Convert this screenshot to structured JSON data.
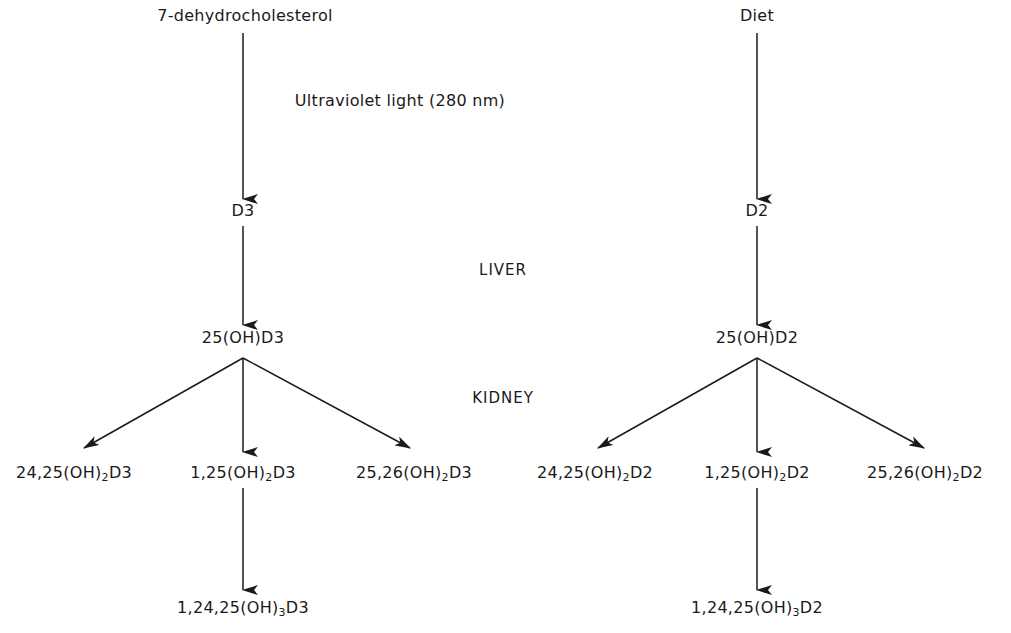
{
  "diagram": {
    "title": "",
    "colors": {
      "line": "#1a1a1a",
      "background": "#ffffff"
    },
    "annotations": {
      "uv": "Ultraviolet light (280 nm)",
      "liver": "LIVER",
      "kidney": "KIDNEY"
    },
    "left": {
      "source": "7-dehydrocholesterol",
      "vitamin": "D3",
      "hydroxy": "25(OH)D3",
      "metabolites": [
        {
          "pre": "24,25(OH)",
          "sub": "2",
          "post": "D3"
        },
        {
          "pre": "1,25(OH)",
          "sub": "2",
          "post": "D3"
        },
        {
          "pre": "25,26(OH)",
          "sub": "2",
          "post": "D3"
        }
      ],
      "final": {
        "pre": "1,24,25(OH)",
        "sub": "3",
        "post": "D3"
      }
    },
    "right": {
      "source": "Diet",
      "vitamin": "D2",
      "hydroxy": "25(OH)D2",
      "metabolites": [
        {
          "pre": "24,25(OH)",
          "sub": "2",
          "post": "D2"
        },
        {
          "pre": "1,25(OH)",
          "sub": "2",
          "post": "D2"
        },
        {
          "pre": "25,26(OH)",
          "sub": "2",
          "post": "D2"
        }
      ],
      "final": {
        "pre": "1,24,25(OH)",
        "sub": "3",
        "post": "D2"
      }
    },
    "edges": [
      {
        "from": "7-dehydrocholesterol",
        "to": "D3"
      },
      {
        "from": "D3",
        "to": "25(OH)D3"
      },
      {
        "from": "25(OH)D3",
        "to": "24,25(OH)2D3"
      },
      {
        "from": "25(OH)D3",
        "to": "1,25(OH)2D3"
      },
      {
        "from": "25(OH)D3",
        "to": "25,26(OH)2D3"
      },
      {
        "from": "1,25(OH)2D3",
        "to": "1,24,25(OH)3D3"
      },
      {
        "from": "Diet",
        "to": "D2"
      },
      {
        "from": "D2",
        "to": "25(OH)D2"
      },
      {
        "from": "25(OH)D2",
        "to": "24,25(OH)2D2"
      },
      {
        "from": "25(OH)D2",
        "to": "1,25(OH)2D2"
      },
      {
        "from": "25(OH)D2",
        "to": "25,26(OH)2D2"
      },
      {
        "from": "1,25(OH)2D2",
        "to": "1,24,25(OH)3D2"
      }
    ]
  }
}
